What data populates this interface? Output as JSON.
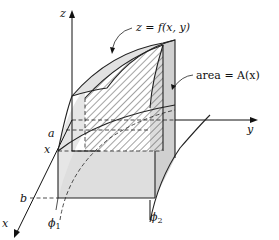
{
  "figure": {
    "axes": {
      "z_label": "z",
      "y_label": "y",
      "x_label": "x"
    },
    "annotations": {
      "surface": "z = f(x, y)",
      "area": "area = A(x)"
    },
    "x_axis_marks": {
      "a": "a",
      "x": "x",
      "b": "b"
    },
    "curve_labels": {
      "phi1": "ϕ",
      "phi1_sub": "1",
      "phi2": "ϕ",
      "phi2_sub": "2"
    },
    "colors": {
      "shade_light": "#e4e4e4",
      "shade_medium": "#d2d2d2",
      "hatch": "#333333",
      "line": "#222222"
    }
  }
}
